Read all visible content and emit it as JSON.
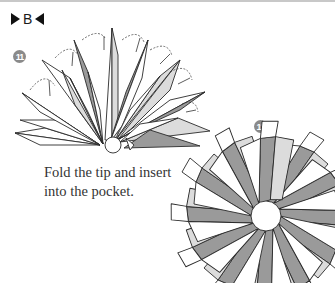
{
  "page": {
    "section": {
      "label": "B",
      "left_marker": "▶",
      "right_marker": "◀"
    },
    "steps": [
      {
        "number": "11",
        "diagram": "half-assembled-star-fan",
        "description_arrows": "fold-tip-arrows"
      },
      {
        "number": "12",
        "diagram": "completed-rosette",
        "caption": "Fold the tip and insert into the pocket."
      }
    ],
    "colors": {
      "dark_fill": "#9a9a9a",
      "light_fill": "#dcdcdc",
      "white_fill": "#ffffff",
      "line": "#2a2a2a",
      "step_badge": "#8a8a8a"
    }
  }
}
